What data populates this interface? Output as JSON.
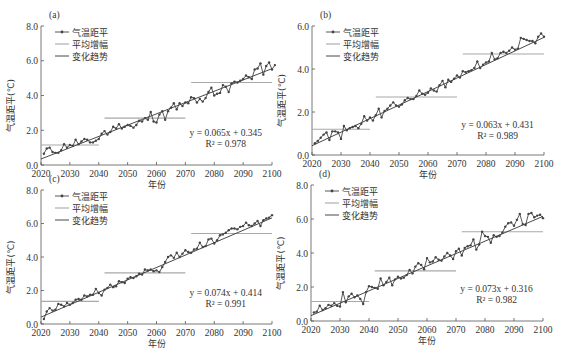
{
  "chart_data": [
    {
      "type": "line",
      "panel_label": "(a)",
      "xlabel": "年份",
      "ylabel": "气温距平(℃)",
      "xlim": [
        2020,
        2100
      ],
      "ylim": [
        0,
        8
      ],
      "xticks": [
        "2020",
        "2030",
        "2040",
        "2050",
        "2060",
        "2070",
        "2080",
        "2090",
        "2100"
      ],
      "yticks": [
        "0.0",
        "2.0",
        "4.0",
        "6.0",
        "8.0"
      ],
      "legend": [
        "气温距平",
        "平均增幅",
        "变化趋势"
      ],
      "legend_position": "upper left",
      "equation": "y = 0.065x + 0.345",
      "r2": "R² = 0.978",
      "trend": {
        "slope": 0.065,
        "intercept": 0.345
      },
      "mean_segments": [
        {
          "x0": 2020,
          "x1": 2040,
          "y": 1.15
        },
        {
          "x0": 2042,
          "x1": 2070,
          "y": 2.7
        },
        {
          "x0": 2072,
          "x1": 2100,
          "y": 4.75
        }
      ],
      "series": [
        {
          "name": "气温距平",
          "x_start": 2021,
          "values": [
            0.65,
            0.95,
            1.0,
            0.75,
            0.7,
            0.7,
            0.85,
            1.2,
            1.0,
            1.15,
            1.1,
            1.45,
            1.2,
            1.35,
            1.5,
            1.45,
            1.3,
            1.3,
            1.4,
            1.5,
            1.8,
            1.95,
            1.75,
            1.9,
            2.2,
            2.1,
            2.35,
            2.1,
            2.2,
            2.3,
            2.25,
            2.15,
            2.3,
            2.55,
            2.5,
            2.7,
            2.6,
            3.05,
            2.5,
            2.45,
            2.9,
            3.1,
            2.6,
            3.1,
            3.3,
            3.55,
            3.2,
            3.55,
            3.4,
            3.6,
            3.55,
            3.9,
            3.85,
            3.6,
            3.8,
            3.65,
            3.85,
            4.2,
            4.45,
            4.0,
            4.1,
            4.15,
            4.6,
            4.5,
            4.2,
            4.7,
            4.8,
            4.75,
            4.85,
            4.95,
            5.15,
            5.05,
            4.95,
            5.5,
            5.55,
            5.85,
            5.2,
            5.7,
            5.9,
            5.5,
            5.75
          ]
        }
      ]
    },
    {
      "type": "line",
      "panel_label": "(b)",
      "xlabel": "年份",
      "ylabel": "气温距平(℃)",
      "xlim": [
        2020,
        2100
      ],
      "ylim": [
        0,
        6
      ],
      "xticks": [
        "2020",
        "2030",
        "2040",
        "2050",
        "2060",
        "2070",
        "2080",
        "2090",
        "2100"
      ],
      "yticks": [
        "0.0",
        "2.0",
        "4.0",
        "6.0"
      ],
      "legend": [
        "气温距平",
        "平均增幅",
        "变化趋势"
      ],
      "legend_position": "upper left",
      "equation": "y = 0.063x + 0.431",
      "r2": "R² = 0.989",
      "trend": {
        "slope": 0.063,
        "intercept": 0.431
      },
      "mean_segments": [
        {
          "x0": 2020,
          "x1": 2040,
          "y": 1.2
        },
        {
          "x0": 2042,
          "x1": 2070,
          "y": 2.7
        },
        {
          "x0": 2072,
          "x1": 2100,
          "y": 4.7
        }
      ],
      "series": [
        {
          "name": "气温距平",
          "x_start": 2021,
          "values": [
            0.55,
            0.65,
            0.8,
            0.95,
            1.05,
            0.7,
            1.1,
            1.1,
            1.05,
            0.75,
            1.35,
            1.15,
            1.25,
            1.3,
            1.35,
            1.25,
            1.45,
            1.8,
            1.6,
            1.75,
            1.6,
            1.85,
            2.15,
            1.75,
            2.05,
            2.15,
            2.3,
            2.45,
            2.3,
            2.25,
            2.35,
            2.55,
            2.65,
            2.6,
            2.6,
            2.75,
            3.0,
            2.85,
            2.8,
            2.9,
            3.1,
            3.0,
            2.95,
            3.25,
            3.45,
            3.15,
            3.5,
            3.4,
            3.55,
            3.7,
            3.6,
            3.9,
            3.85,
            3.9,
            3.95,
            4.05,
            4.35,
            4.05,
            4.2,
            4.3,
            4.35,
            4.75,
            4.45,
            4.5,
            4.75,
            4.8,
            4.75,
            4.85,
            5.0,
            4.9,
            4.95,
            5.45,
            5.4,
            5.35,
            5.3,
            5.3,
            5.2,
            5.5,
            5.65,
            5.5
          ]
        }
      ]
    },
    {
      "type": "line",
      "panel_label": "(c)",
      "xlabel": "年份",
      "ylabel": "气温距平(℃)",
      "xlim": [
        2020,
        2100
      ],
      "ylim": [
        0,
        8
      ],
      "xticks": [
        "2020",
        "2030",
        "2040",
        "2050",
        "2060",
        "2070",
        "2080",
        "2090",
        "2100"
      ],
      "yticks": [
        "0.0",
        "2.0",
        "4.0",
        "6.0",
        "8.0"
      ],
      "legend": [
        "气温距平",
        "平均增幅",
        "变化趋势"
      ],
      "legend_position": "upper left",
      "equation": "y = 0.074x + 0.414",
      "r2": "R² = 0.991",
      "trend": {
        "slope": 0.074,
        "intercept": 0.414
      },
      "mean_segments": [
        {
          "x0": 2020,
          "x1": 2040,
          "y": 1.35
        },
        {
          "x0": 2042,
          "x1": 2070,
          "y": 3.05
        },
        {
          "x0": 2072,
          "x1": 2100,
          "y": 5.4
        }
      ],
      "series": [
        {
          "name": "气温距平",
          "x_start": 2021,
          "values": [
            0.3,
            0.75,
            0.95,
            0.8,
            0.85,
            1.2,
            1.15,
            1.05,
            1.25,
            1.15,
            1.25,
            1.45,
            1.5,
            1.45,
            1.7,
            1.65,
            1.75,
            1.75,
            2.1,
            1.85,
            1.7,
            2.05,
            2.15,
            2.35,
            2.2,
            2.25,
            2.55,
            2.5,
            2.45,
            2.7,
            2.8,
            2.75,
            2.85,
            3.0,
            2.95,
            3.25,
            3.2,
            3.25,
            3.15,
            3.2,
            3.1,
            3.4,
            3.7,
            4.0,
            4.1,
            3.95,
            4.25,
            4.0,
            4.2,
            4.4,
            4.3,
            4.25,
            4.45,
            4.5,
            4.85,
            4.6,
            4.65,
            5.05,
            5.1,
            4.8,
            5.0,
            5.3,
            5.35,
            5.45,
            5.6,
            5.7,
            5.7,
            5.65,
            5.8,
            5.85,
            6.05,
            5.9,
            5.85,
            6.0,
            6.15,
            5.85,
            6.2,
            6.3,
            6.35,
            6.5
          ]
        }
      ]
    },
    {
      "type": "line",
      "panel_label": "(d)",
      "xlabel": "年份",
      "ylabel": "气温距平(℃)",
      "xlim": [
        2020,
        2100
      ],
      "ylim": [
        0,
        8
      ],
      "xticks": [
        "2020",
        "2030",
        "2040",
        "2050",
        "2060",
        "2070",
        "2080",
        "2090",
        "2100"
      ],
      "yticks": [
        "0.0",
        "2.0",
        "4.0",
        "6.0",
        "8.0"
      ],
      "legend": [
        "气温距平",
        "平均增幅",
        "变化趋势"
      ],
      "legend_position": "upper left",
      "equation": "y = 0.073x + 0.316",
      "r2": "R² = 0.982",
      "trend": {
        "slope": 0.073,
        "intercept": 0.316
      },
      "mean_segments": [
        {
          "x0": 2020,
          "x1": 2040,
          "y": 1.15
        },
        {
          "x0": 2042,
          "x1": 2070,
          "y": 2.95
        },
        {
          "x0": 2072,
          "x1": 2100,
          "y": 5.25
        }
      ],
      "series": [
        {
          "name": "气温距平",
          "x_start": 2021,
          "values": [
            0.5,
            0.55,
            0.9,
            0.65,
            0.75,
            0.95,
            0.9,
            1.05,
            0.9,
            0.85,
            1.7,
            1.1,
            1.45,
            1.6,
            1.4,
            1.5,
            1.3,
            1.0,
            1.7,
            2.05,
            2.0,
            1.95,
            1.9,
            2.5,
            2.1,
            2.3,
            2.55,
            2.1,
            2.45,
            2.6,
            2.5,
            2.55,
            2.7,
            3.0,
            2.8,
            3.2,
            3.4,
            3.3,
            3.05,
            3.7,
            3.45,
            3.5,
            3.75,
            3.6,
            3.55,
            3.8,
            4.0,
            3.85,
            3.65,
            4.1,
            4.25,
            3.85,
            4.3,
            4.4,
            4.45,
            4.8,
            4.2,
            4.5,
            5.25,
            5.0,
            4.95,
            4.6,
            5.05,
            4.95,
            5.0,
            5.2,
            5.55,
            5.75,
            5.8,
            5.6,
            5.95,
            6.3,
            5.7,
            5.65,
            6.3,
            6.35,
            6.1,
            6.2,
            6.25,
            6.05
          ]
        }
      ]
    }
  ],
  "ui": {
    "panels": [
      {
        "label": "(a)",
        "xlabel": "年份",
        "ylabel": "气温距平(℃)",
        "equation": "y = 0.065x + 0.345",
        "r2_label": "R² = 0.978"
      },
      {
        "label": "(b)",
        "xlabel": "年份",
        "ylabel": "气温距平(℃)",
        "equation": "y = 0.063x + 0.431",
        "r2_label": "R² = 0.989"
      },
      {
        "label": "(c)",
        "xlabel": "年份",
        "ylabel": "气温距平(℃)",
        "equation": "y = 0.074x + 0.414",
        "r2_label": "R² = 0.991"
      },
      {
        "label": "(d)",
        "xlabel": "年份",
        "ylabel": "气温距平(℃)",
        "equation": "y = 0.073x + 0.316",
        "r2_label": "R² = 0.982"
      }
    ],
    "legend": [
      "气温距平",
      "平均增幅",
      "变化趋势"
    ],
    "colors": {
      "data": "#444444",
      "mean": "#a8a8a8",
      "trend": "#333333",
      "axis": "#555555"
    }
  },
  "layout": [
    {
      "left": 41,
      "right": 272,
      "top": 26,
      "bottom": 165
    },
    {
      "left": 312,
      "right": 544,
      "top": 26,
      "bottom": 155
    },
    {
      "left": 41,
      "right": 272,
      "top": 190,
      "bottom": 324
    },
    {
      "left": 311,
      "right": 543,
      "top": 185,
      "bottom": 321
    }
  ]
}
